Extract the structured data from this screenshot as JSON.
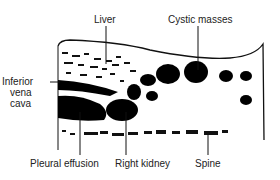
{
  "diagram": {
    "labels": {
      "liver": "Liver",
      "cystic_masses": "Cystic masses",
      "ivc_line1": "Inferior",
      "ivc_line2": "vena",
      "ivc_line3": "cava",
      "pleural_effusion": "Pleural effusion",
      "right_kidney": "Right kidney",
      "spine": "Spine"
    }
  }
}
